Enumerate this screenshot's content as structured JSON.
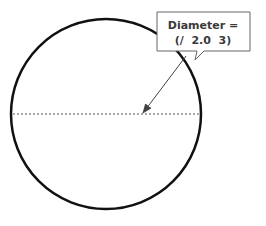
{
  "diagram": {
    "circle": {
      "cx": 106,
      "cy": 114,
      "r": 95,
      "stroke": "#111111"
    },
    "diameter_line": {
      "x1": 13,
      "x2": 200,
      "y": 114,
      "style": "dashed",
      "color": "#555555"
    },
    "callout": {
      "line1": "Diameter =",
      "line2": "(/  2.0  3)",
      "border_color": "#666666"
    },
    "arrow": {
      "from": [
        186,
        56
      ],
      "to": [
        142,
        114
      ],
      "color": "#444444"
    }
  }
}
